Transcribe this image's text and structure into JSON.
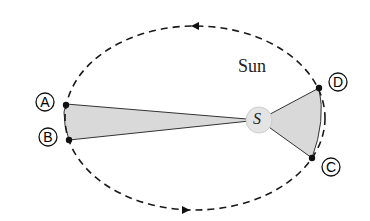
{
  "diagram": {
    "sun_label": "Sun",
    "sun_symbol": "S",
    "points": [
      {
        "id": "A",
        "label": "A"
      },
      {
        "id": "B",
        "label": "B"
      },
      {
        "id": "C",
        "label": "C"
      },
      {
        "id": "D",
        "label": "D"
      }
    ],
    "colors": {
      "orbit": "#1a1a1a",
      "sector_fill": "#d9d9d9",
      "sun_fill": "#e4e4e4"
    }
  }
}
